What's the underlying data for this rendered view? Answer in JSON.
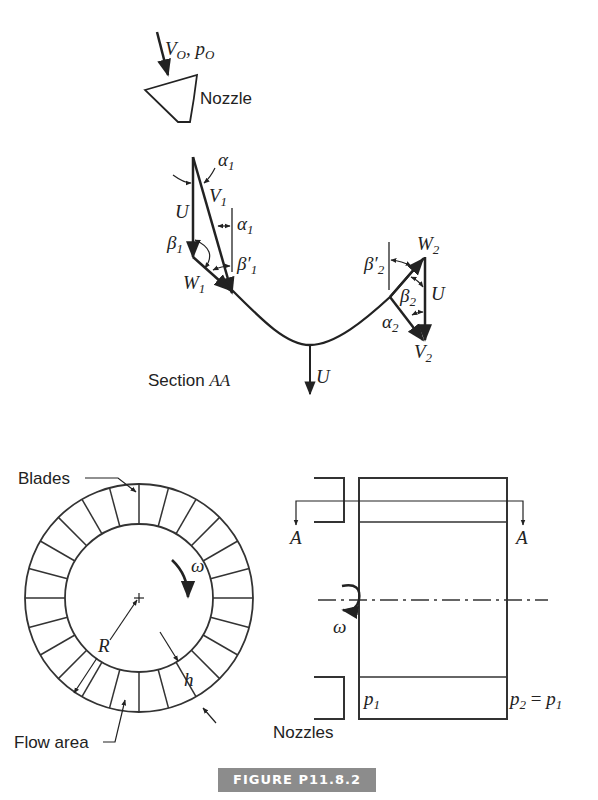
{
  "figure": {
    "caption": "FIGURE P11.8.2"
  },
  "top_view": {
    "inlet_label_V": "V",
    "inlet_label_V_sub": "O",
    "inlet_label_p": "p",
    "inlet_label_p_sub": "O",
    "nozzle_label": "Nozzle",
    "section_label": "Section ",
    "section_label_italic": "AA",
    "blade_speed_label": "U",
    "inlet_triangle": {
      "alpha1": "α",
      "alpha1_sub": "1",
      "V1": "V",
      "V1_sub": "1",
      "U": "U",
      "beta1": "β",
      "beta1_sub": "1",
      "beta1_prime": "β′",
      "beta1_prime_sub": "1",
      "W1": "W",
      "W1_sub": "1"
    },
    "outlet_triangle": {
      "beta2_prime": "β′",
      "beta2_prime_sub": "2",
      "W2": "W",
      "W2_sub": "2",
      "beta2": "β",
      "beta2_sub": "2",
      "U": "U",
      "alpha2": "α",
      "alpha2_sub": "2",
      "V2": "V",
      "V2_sub": "2"
    }
  },
  "wheel_view": {
    "blades_label": "Blades",
    "omega_label": "ω",
    "radius_label": "R",
    "height_label": "h",
    "flow_area_label": "Flow area",
    "blade_count": 24
  },
  "side_view": {
    "section_A_left": "A",
    "section_A_right": "A",
    "omega_label": "ω",
    "p1_label": "p",
    "p1_sub": "1",
    "p2_label": "p",
    "p2_sub": "2",
    "p2_eq": " = ",
    "p2_rhs": "p",
    "p2_rhs_sub": "1",
    "nozzles_label": "Nozzles"
  }
}
